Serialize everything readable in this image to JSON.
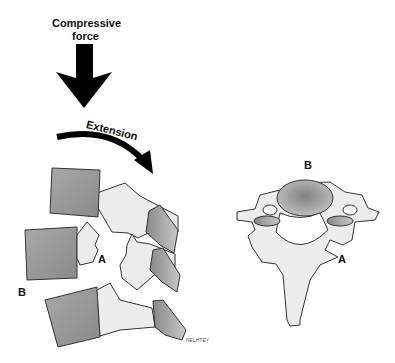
{
  "labels": {
    "compressive_line1": "Compressive",
    "compressive_line2": "force",
    "extension": "Extension",
    "lateral_A": "A",
    "lateral_B": "B",
    "axial_A": "A",
    "axial_B": "B",
    "signature": "NELHTEY"
  },
  "colors": {
    "body_fill": "#9a9a9a",
    "body_stroke": "#333333",
    "process_fill": "#ececec",
    "arrow": "#000000",
    "background": "#ffffff"
  }
}
